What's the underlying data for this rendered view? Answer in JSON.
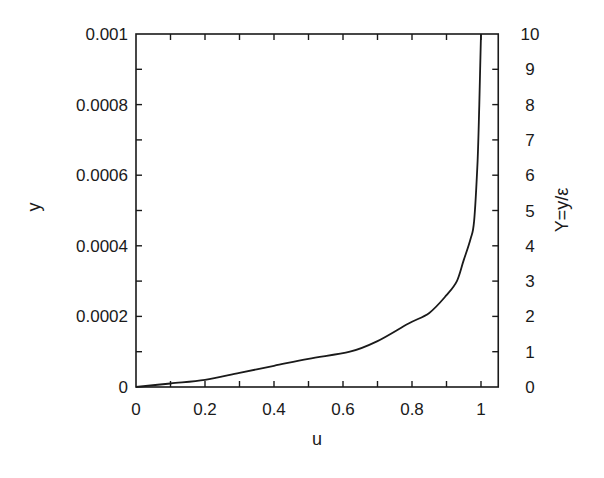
{
  "chart_data": {
    "type": "line",
    "title": "",
    "xlabel": "u",
    "ylabel": "y",
    "ylabel_right": "Y=y/ε",
    "xlim": [
      0,
      1.05
    ],
    "ylim": [
      0,
      0.001
    ],
    "ylim_right": [
      0,
      10
    ],
    "grid": false,
    "legend": null,
    "x_ticks": [
      "0",
      "0.2",
      "0.4",
      "0.6",
      "0.8",
      "1"
    ],
    "x_tick_values": [
      0,
      0.2,
      0.4,
      0.6,
      0.8,
      1.0
    ],
    "x_minor_ticks": [
      0.1,
      0.3,
      0.5,
      0.7,
      0.9
    ],
    "y_ticks": [
      "0",
      "0.0002",
      "0.0004",
      "0.0006",
      "0.0008",
      "0.001"
    ],
    "y_tick_values": [
      0,
      0.0002,
      0.0004,
      0.0006,
      0.0008,
      0.001
    ],
    "y_minor_ticks": [
      0.0001,
      0.0003,
      0.0005,
      0.0007,
      0.0009
    ],
    "y_right_ticks": [
      "0",
      "1",
      "2",
      "3",
      "4",
      "5",
      "6",
      "7",
      "8",
      "9",
      "10"
    ],
    "y_right_tick_values": [
      0,
      1,
      2,
      3,
      4,
      5,
      6,
      7,
      8,
      9,
      10
    ],
    "series": [
      {
        "name": "velocity profile",
        "x": [
          0,
          0.1,
          0.2,
          0.3,
          0.4,
          0.5,
          0.62,
          0.7,
          0.79,
          0.85,
          0.9,
          0.93,
          0.95,
          0.97,
          0.98,
          0.99,
          0.995,
          1.0
        ],
        "y": [
          0,
          1e-05,
          2e-05,
          4e-05,
          6e-05,
          8e-05,
          0.0001,
          0.00013,
          0.00018,
          0.00021,
          0.00026,
          0.0003,
          0.00036,
          0.00042,
          0.00047,
          0.00064,
          0.0008,
          0.001
        ]
      }
    ]
  }
}
